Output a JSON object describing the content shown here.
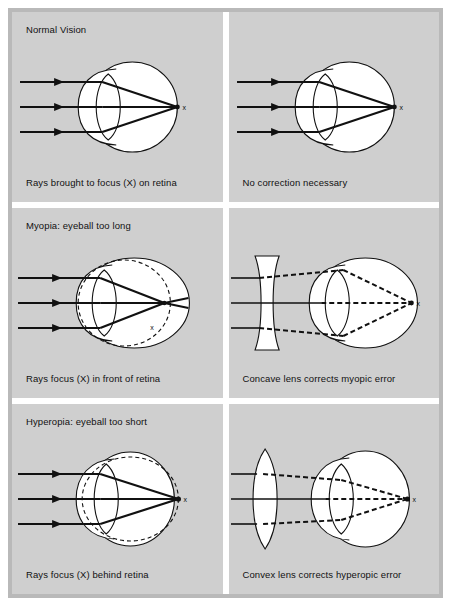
{
  "figure": {
    "title_semantic": "refractive-error-diagram",
    "outer_background": "#ffffff",
    "frame_color": "#b9b9b9",
    "panel_background": "#cfcfcf",
    "ink_color": "#111111",
    "eye_fill": "#ffffff"
  },
  "panels": [
    {
      "id": "normal-left",
      "title": "Normal Vision",
      "caption": "Rays brought to focus (X) on retina",
      "focus_label": "x",
      "eye_shape": "normal",
      "ray_style": "solid",
      "correction_lens": "none",
      "dashed_reference_outline": false
    },
    {
      "id": "normal-right",
      "title": "",
      "caption": "No correction necessary",
      "focus_label": "x",
      "eye_shape": "normal",
      "ray_style": "solid",
      "correction_lens": "none",
      "dashed_reference_outline": false
    },
    {
      "id": "myopia-left",
      "title": "Myopia: eyeball too long",
      "caption": "Rays focus (X) in front of retina",
      "focus_label": "x",
      "eye_shape": "elongated",
      "ray_style": "solid",
      "correction_lens": "none",
      "dashed_reference_outline": true
    },
    {
      "id": "myopia-right",
      "title": "",
      "caption": "Concave lens corrects myopic error",
      "focus_label": "x",
      "eye_shape": "elongated",
      "ray_style": "dashed",
      "correction_lens": "concave",
      "dashed_reference_outline": false
    },
    {
      "id": "hyperopia-left",
      "title": "Hyperopia: eyeball too short",
      "caption": "Rays focus (X) behind retina",
      "focus_label": "x",
      "eye_shape": "shortened",
      "ray_style": "solid",
      "correction_lens": "none",
      "dashed_reference_outline": true
    },
    {
      "id": "hyperopia-right",
      "title": "",
      "caption": "Convex lens corrects hyperopic error",
      "focus_label": "x",
      "eye_shape": "shortened",
      "ray_style": "dashed",
      "correction_lens": "convex",
      "dashed_reference_outline": false
    }
  ],
  "legend_terms": {
    "focus_point": "X",
    "concave_lens": "Concave lens",
    "convex_lens": "Convex lens",
    "retina": "retina"
  }
}
